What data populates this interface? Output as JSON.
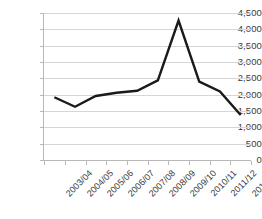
{
  "chart_data": {
    "type": "line",
    "title": "",
    "subtitle": "",
    "xlabel": "",
    "ylabel": "",
    "categories": [
      "2003/04",
      "2004/05",
      "2005/06",
      "2006/07",
      "2007/08",
      "2008/09",
      "2009/10",
      "2010/11",
      "2011/12",
      "2012/13"
    ],
    "series": [
      {
        "name": "",
        "color": "#1a1a1a",
        "values": [
          1920,
          1630,
          1960,
          2060,
          2120,
          2440,
          4270,
          2400,
          2100,
          1380
        ]
      }
    ],
    "ylim": [
      0,
      4500
    ],
    "ytick_labels": [
      "0",
      "500",
      "1,000",
      "1,500",
      "2,000",
      "2,500",
      "3,000",
      "3,500",
      "4,000",
      "4,500"
    ],
    "ytick_values": [
      0,
      500,
      1000,
      1500,
      2000,
      2500,
      3000,
      3500,
      4000,
      4500
    ],
    "grid": true,
    "grid_axis": "y",
    "legend": false,
    "legend_position": "none",
    "markers": false,
    "xtick_rotation": -45,
    "colors": {
      "line": "#1a1a1a",
      "gridline": "#d6d6d6",
      "axis": "#b8b8b8",
      "text": "#3a3a3a",
      "background": "#ffffff"
    }
  }
}
